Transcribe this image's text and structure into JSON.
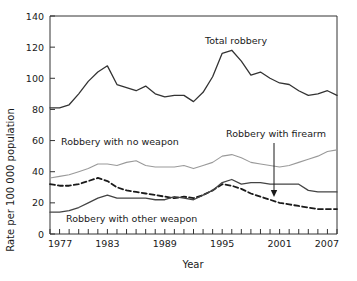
{
  "chart_data": {
    "type": "line",
    "title": "",
    "xlabel": "Year",
    "ylabel": "Rate per 100 000 population",
    "xlim": [
      1977,
      2007
    ],
    "ylim": [
      0,
      140
    ],
    "ytick_step": 20,
    "xtick_step": 1,
    "xlabel_step": 6,
    "grid": false,
    "legend_position": "inline-annotations",
    "xticklabels": [
      "1977",
      "1983",
      "1989",
      "1995",
      "2001",
      "2007"
    ],
    "yticklabels": [
      "0",
      "20",
      "40",
      "60",
      "80",
      "100",
      "120",
      "140"
    ],
    "x": [
      1977,
      1978,
      1979,
      1980,
      1981,
      1982,
      1983,
      1984,
      1985,
      1986,
      1987,
      1988,
      1989,
      1990,
      1991,
      1992,
      1993,
      1994,
      1995,
      1996,
      1997,
      1998,
      1999,
      2000,
      2001,
      2002,
      2003,
      2004,
      2005,
      2006,
      2007
    ],
    "series": [
      {
        "name": "Total robbery",
        "style": "solid-dark",
        "color": "#333333",
        "values": [
          81,
          81,
          83,
          90,
          98,
          104,
          108,
          96,
          94,
          92,
          95,
          90,
          88,
          89,
          89,
          85,
          91,
          101,
          116,
          118,
          111,
          102,
          104,
          100,
          97,
          96,
          92,
          89,
          90,
          92,
          89
        ]
      },
      {
        "name": "Robbery with no weapon",
        "style": "solid-light",
        "color": "#9a9a9a",
        "values": [
          36,
          37,
          38,
          40,
          42,
          45,
          45,
          44,
          46,
          47,
          44,
          43,
          43,
          43,
          44,
          42,
          44,
          46,
          50,
          51,
          49,
          46,
          45,
          44,
          43,
          44,
          46,
          48,
          50,
          53,
          54
        ]
      },
      {
        "name": "Robbery with firearm",
        "style": "dashed",
        "color": "#1a1a1a",
        "values": [
          32,
          31,
          31,
          32,
          34,
          36,
          34,
          30,
          28,
          27,
          26,
          25,
          24,
          23,
          24,
          23,
          25,
          28,
          32,
          31,
          29,
          26,
          24,
          22,
          20,
          19,
          18,
          17,
          16,
          16,
          16
        ]
      },
      {
        "name": "Robbery with other weapon",
        "style": "solid-mid",
        "color": "#444444",
        "values": [
          14,
          14,
          15,
          17,
          20,
          23,
          25,
          23,
          23,
          23,
          23,
          22,
          22,
          24,
          23,
          22,
          25,
          28,
          33,
          35,
          32,
          33,
          33,
          32,
          32,
          32,
          32,
          28,
          27,
          27,
          27
        ]
      }
    ],
    "annotations": [
      {
        "name": "total-robbery-label",
        "text": "Total robbery",
        "x": 205,
        "y": 44
      },
      {
        "name": "no-weapon-label",
        "text": "Robbery with no weapon",
        "x": 61,
        "y": 145
      },
      {
        "name": "firearm-label",
        "text": "Robbery with firearm",
        "x": 226,
        "y": 137
      },
      {
        "name": "other-weapon-label",
        "text": "Robbery with other weapon",
        "x": 66,
        "y": 222
      }
    ],
    "arrow": {
      "name": "firearm-arrow",
      "x": 274,
      "y_start": 143,
      "y_end": 197
    }
  }
}
